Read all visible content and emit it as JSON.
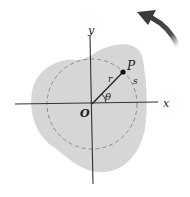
{
  "diagram": {
    "labels": {
      "x_axis": "x",
      "y_axis": "y",
      "origin": "O",
      "point": "P",
      "radius": "r",
      "arc": "s",
      "angle": "θ"
    },
    "colors": {
      "body_fill": "#d6d6d6",
      "axis": "#333333",
      "dashed_circle": "#8c8c8c",
      "arrow": "#3a3a3a"
    },
    "rotation_direction": "counterclockwise"
  }
}
